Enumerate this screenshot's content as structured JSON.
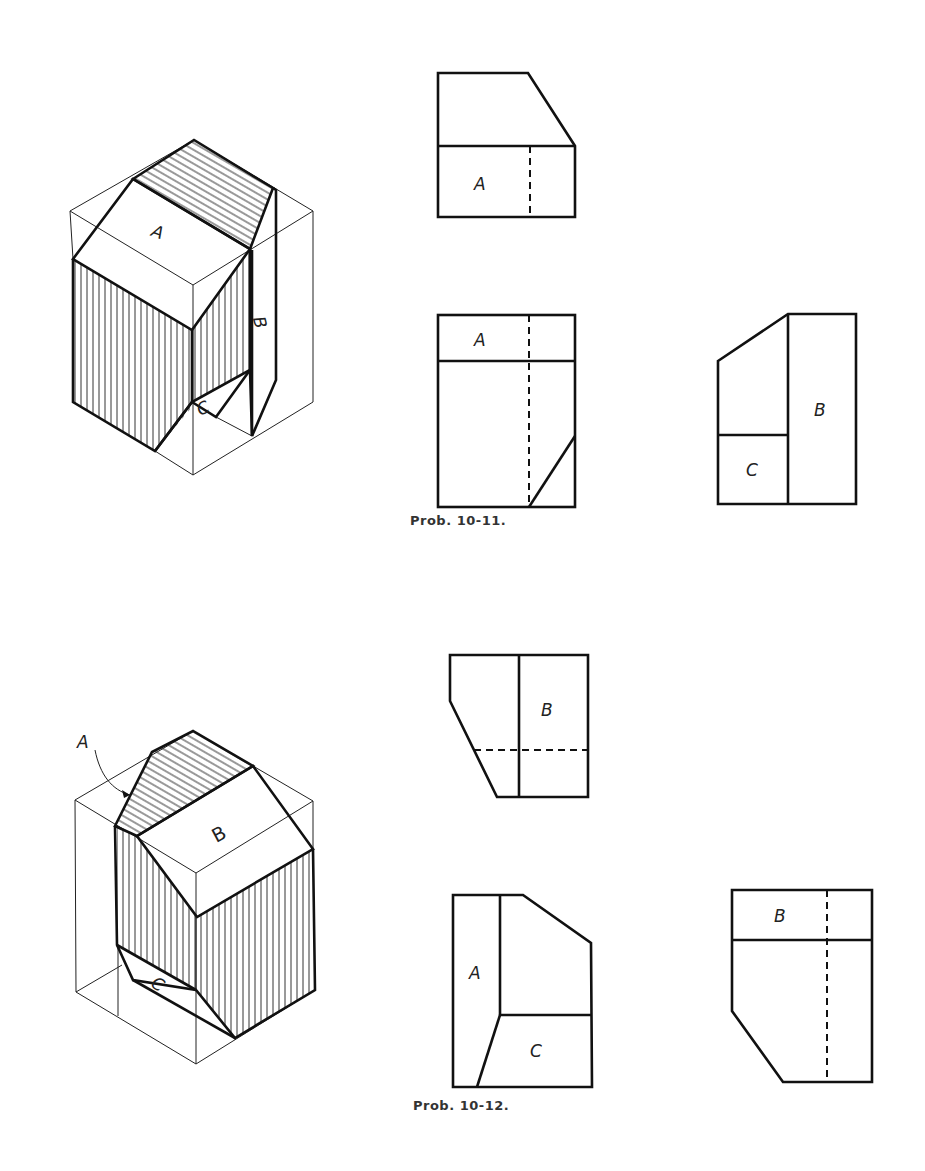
{
  "page": {
    "background": "#ffffff",
    "ink_color": "#111111"
  },
  "problems": [
    {
      "id": "10-11",
      "caption": "Prob. 10-11.",
      "pictorial": {
        "surface_labels": [
          "A",
          "B",
          "C"
        ],
        "hatched_faces": [
          "top-sloped",
          "left-front",
          "right-front"
        ]
      },
      "views": {
        "top": {
          "labels": [
            "A"
          ]
        },
        "front": {
          "labels": [
            "A"
          ]
        },
        "side": {
          "labels": [
            "B",
            "C"
          ]
        }
      }
    },
    {
      "id": "10-12",
      "caption": "Prob. 10-12.",
      "pictorial": {
        "surface_labels": [
          "A",
          "B",
          "C"
        ],
        "leader_label": "A",
        "hatched_faces": [
          "top-sloped",
          "left-front",
          "right-front"
        ]
      },
      "views": {
        "top": {
          "labels": [
            "B"
          ]
        },
        "front": {
          "labels": [
            "A",
            "C"
          ]
        },
        "side": {
          "labels": [
            "B"
          ]
        }
      }
    }
  ]
}
